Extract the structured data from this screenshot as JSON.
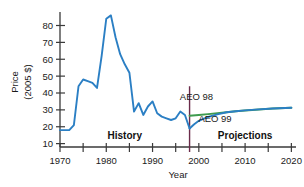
{
  "chart_data": {
    "type": "line",
    "title": "",
    "xlabel": "Year",
    "ylabel": "Price (2005 $)",
    "ylabel_line1": "Price",
    "ylabel_line2": "(2005 $)",
    "xlim": [
      1970,
      2021
    ],
    "ylim": [
      8,
      88
    ],
    "grid": false,
    "legend_position": "inline-annotations",
    "xticks": [
      1970,
      1975,
      1980,
      1985,
      1990,
      1995,
      2000,
      2005,
      2010,
      2015,
      2020
    ],
    "xtick_labels": [
      "1970",
      "",
      "1980",
      "",
      "1990",
      "",
      "2000",
      "",
      "2010",
      "",
      "2020"
    ],
    "yticks": [
      10,
      20,
      30,
      40,
      50,
      60,
      70,
      80
    ],
    "ytick_labels": [
      "10",
      "20",
      "30",
      "40",
      "50",
      "60",
      "70",
      "80"
    ],
    "divider_year": 1998,
    "annotations": [
      {
        "text": "History",
        "x": 1984,
        "y": 13,
        "bold": true
      },
      {
        "text": "Projections",
        "x": 2010,
        "y": 13,
        "bold": true
      },
      {
        "text": "AEO 98",
        "x": 1999.5,
        "y": 36,
        "bold": false
      },
      {
        "text": "AEO 99",
        "x": 2003.5,
        "y": 23,
        "bold": false
      }
    ],
    "series": [
      {
        "name": "History",
        "color": "#2b7fc4",
        "x": [
          1970,
          1971,
          1972,
          1973,
          1974,
          1975,
          1976,
          1977,
          1978,
          1979,
          1980,
          1981,
          1982,
          1983,
          1984,
          1985,
          1986,
          1987,
          1988,
          1989,
          1990,
          1991,
          1992,
          1993,
          1994,
          1995,
          1996,
          1997,
          1998
        ],
        "values": [
          18,
          18,
          18,
          21,
          44,
          48,
          47,
          46,
          43,
          62,
          84,
          86,
          73,
          63,
          57,
          52,
          29,
          34,
          27,
          32,
          35,
          28,
          26,
          25,
          24,
          25,
          29,
          27,
          19
        ]
      },
      {
        "name": "AEO 98",
        "color": "#3f9b4f",
        "x": [
          1998,
          2000,
          2002,
          2004,
          2006,
          2008,
          2010,
          2013,
          2016,
          2020
        ],
        "values": [
          26.5,
          27.0,
          27.5,
          28.0,
          28.6,
          29.2,
          29.6,
          30.2,
          30.8,
          31.3
        ]
      },
      {
        "name": "AEO 99",
        "color": "#2b7fc4",
        "x": [
          1998,
          1999,
          2000,
          2002,
          2004,
          2006,
          2008,
          2010,
          2013,
          2016,
          2020
        ],
        "values": [
          19,
          21.5,
          23.5,
          25.8,
          27.3,
          28.6,
          29.2,
          29.7,
          30.3,
          30.8,
          31.3
        ]
      }
    ]
  },
  "axis": {
    "axis_color": "#3a3a3a",
    "divider_color": "#6b2b4a"
  }
}
